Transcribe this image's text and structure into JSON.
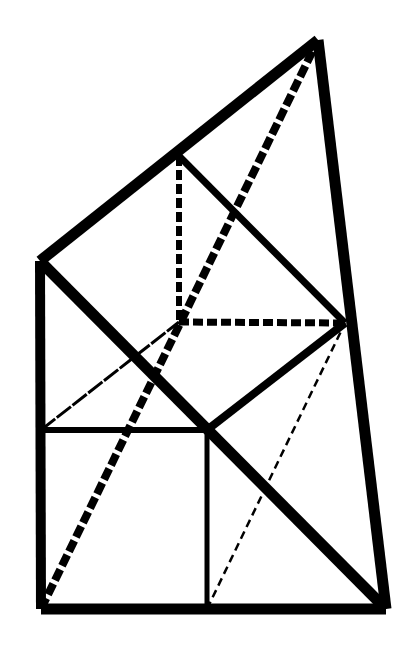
{
  "diagram": {
    "title": "",
    "background": "#ffffff",
    "stroke_color": "#000000",
    "points": {
      "A": [
        318,
        40
      ],
      "B": [
        40,
        261
      ],
      "C": [
        41,
        609
      ],
      "D": [
        386,
        609
      ],
      "E": [
        179,
        156
      ],
      "F": [
        345,
        323
      ],
      "G": [
        179,
        322
      ],
      "H": [
        41,
        430
      ],
      "I": [
        207,
        430
      ],
      "J": [
        207,
        609
      ]
    },
    "segments": [
      {
        "name": "edge-top-left",
        "from": "B",
        "to": "A",
        "width": 11,
        "style": "solid"
      },
      {
        "name": "edge-right",
        "from": "A",
        "to": "D",
        "width": 11,
        "style": "solid"
      },
      {
        "name": "edge-bottom",
        "from": "C",
        "to": "D",
        "width": 11,
        "style": "solid"
      },
      {
        "name": "edge-left",
        "from": "B",
        "to": "C",
        "width": 10,
        "style": "solid"
      },
      {
        "name": "diagonal-main",
        "from": "B",
        "to": "D",
        "width": 11,
        "style": "solid"
      },
      {
        "name": "line-e-f",
        "from": "E",
        "to": "F",
        "width": 7,
        "style": "solid"
      },
      {
        "name": "line-i-f",
        "from": "I",
        "to": "F",
        "width": 8,
        "style": "solid"
      },
      {
        "name": "line-h-i",
        "from": "H",
        "to": "I",
        "width": 6,
        "style": "solid"
      },
      {
        "name": "line-i-j",
        "from": "I",
        "to": "J",
        "width": 5,
        "style": "solid"
      },
      {
        "name": "dashed-e-g",
        "from": "E",
        "to": "G",
        "width": 6,
        "style": "dashed",
        "dash": "10,4"
      },
      {
        "name": "dashed-g-f",
        "from": "G",
        "to": "F",
        "width": 7,
        "style": "dashed",
        "dash": "10,4"
      },
      {
        "name": "dashed-c-a",
        "from": "C",
        "to": "A",
        "width": 8,
        "style": "dashed",
        "dash": "12,4"
      },
      {
        "name": "dashed-h-g",
        "from": "H",
        "to": "G",
        "width": 3,
        "style": "dashed",
        "dash": "18,2"
      },
      {
        "name": "dashed-j-f",
        "from": "J",
        "to": "F",
        "width": 2.5,
        "style": "dashed",
        "dash": "8,5"
      }
    ]
  }
}
